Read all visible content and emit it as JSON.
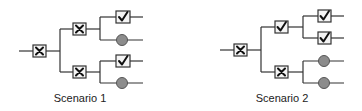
{
  "diagram": {
    "type": "decision-tree-comparison",
    "colors": {
      "line": "#333333",
      "box_fill": "#f4f4f4",
      "circle_fill": "#8c8c8c",
      "background": "#ffffff"
    },
    "scenarios": [
      {
        "label": "Scenario 1",
        "root": "x",
        "level1": [
          "x",
          "x"
        ],
        "leaves": [
          [
            "check",
            "circle"
          ],
          [
            "check",
            "circle"
          ]
        ]
      },
      {
        "label": "Scenario 2",
        "root": "x",
        "level1": [
          "check",
          "x"
        ],
        "leaves": [
          [
            "check",
            "check"
          ],
          [
            "circle",
            "circle"
          ]
        ]
      }
    ]
  }
}
